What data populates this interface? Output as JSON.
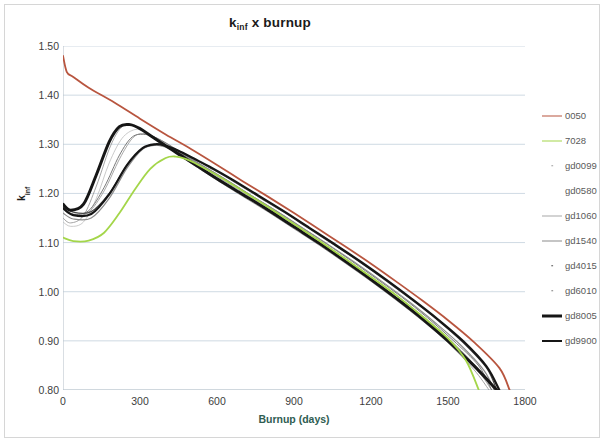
{
  "figure": {
    "title_main": "k",
    "title_sub": "inf",
    "title_tail": " x burnup",
    "title_plain": "k_inf x burnup",
    "background": "#ffffff",
    "border_color": "#d6d6d6"
  },
  "axes": {
    "y_label_main": "k",
    "y_label_sub": "inf",
    "y_label_plain": "k_inf",
    "x_label": "Burnup (days)",
    "x_label_color": "#2f5d52",
    "y_ticks": [
      "1.50",
      "1.40",
      "1.30",
      "1.20",
      "1.10",
      "1.00",
      "0.90",
      "0.80"
    ],
    "x_ticks": [
      "0",
      "300",
      "600",
      "900",
      "1200",
      "1500",
      "1800"
    ],
    "grid_color": "#c3d0dc",
    "axis_color": "#b9c3cc"
  },
  "legend": {
    "position": "right",
    "entries": [
      {
        "label": "0050",
        "color": "#b8553f",
        "style": "line",
        "width": 1.8
      },
      {
        "label": "7028",
        "color": "#a4d64a",
        "style": "line",
        "width": 1.8
      },
      {
        "label": "gd0099",
        "color": "#9a9a9a",
        "style": "dot",
        "width": 0.8
      },
      {
        "label": "gd0580",
        "color": "#bdbdbd",
        "style": "none",
        "width": 0.7
      },
      {
        "label": "gd1060",
        "color": "#a8a8a8",
        "style": "line",
        "width": 1.0
      },
      {
        "label": "gd1540",
        "color": "#8c8c8c",
        "style": "line",
        "width": 1.2
      },
      {
        "label": "gd4015",
        "color": "#4a4a4a",
        "style": "dot",
        "width": 1.2
      },
      {
        "label": "gd6010",
        "color": "#7a7a7a",
        "style": "dot",
        "width": 1.0
      },
      {
        "label": "gd8005",
        "color": "#161616",
        "style": "line",
        "width": 3.0
      },
      {
        "label": "gd9900",
        "color": "#161616",
        "style": "line",
        "width": 2.2
      }
    ]
  },
  "chart_data": {
    "type": "line",
    "xlabel": "Burnup (days)",
    "ylabel": "k_inf",
    "xlim": [
      0,
      1800
    ],
    "ylim": [
      0.8,
      1.5
    ],
    "xticks": [
      0,
      300,
      600,
      900,
      1200,
      1500,
      1800
    ],
    "yticks": [
      0.8,
      0.9,
      1.0,
      1.1,
      1.2,
      1.3,
      1.4,
      1.5
    ],
    "grid": "horizontal",
    "legend_position": "right",
    "series": [
      {
        "name": "0050",
        "color": "#b8553f",
        "width": 1.8,
        "x": [
          0,
          15,
          40,
          100,
          200,
          300,
          400,
          500,
          600,
          700,
          800,
          900,
          1000,
          1100,
          1200,
          1300,
          1400,
          1500,
          1600,
          1700,
          1740
        ],
        "y": [
          1.48,
          1.447,
          1.437,
          1.415,
          1.385,
          1.352,
          1.32,
          1.29,
          1.258,
          1.225,
          1.193,
          1.16,
          1.126,
          1.092,
          1.057,
          1.02,
          0.982,
          0.942,
          0.898,
          0.845,
          0.8
        ]
      },
      {
        "name": "7028",
        "color": "#a4d64a",
        "width": 1.8,
        "x": [
          0,
          40,
          100,
          160,
          220,
          280,
          340,
          400,
          440,
          480,
          520,
          600,
          700,
          800,
          900,
          1000,
          1100,
          1200,
          1300,
          1400,
          1500,
          1570,
          1620
        ],
        "y": [
          1.11,
          1.103,
          1.104,
          1.12,
          1.16,
          1.208,
          1.25,
          1.272,
          1.275,
          1.27,
          1.26,
          1.237,
          1.205,
          1.172,
          1.138,
          1.103,
          1.067,
          1.03,
          0.992,
          0.95,
          0.905,
          0.86,
          0.8
        ]
      },
      {
        "name": "gd0099",
        "color": "#9a9a9a",
        "width": 0.9,
        "x": [
          0,
          30,
          80,
          130,
          180,
          220,
          260,
          300,
          340,
          400,
          460,
          520,
          600,
          700,
          800,
          900,
          1000,
          1100,
          1200,
          1300,
          1400,
          1500,
          1600,
          1660
        ],
        "y": [
          1.15,
          1.14,
          1.155,
          1.215,
          1.29,
          1.33,
          1.342,
          1.332,
          1.318,
          1.296,
          1.275,
          1.254,
          1.227,
          1.194,
          1.162,
          1.128,
          1.094,
          1.058,
          1.021,
          0.982,
          0.941,
          0.896,
          0.842,
          0.8
        ]
      },
      {
        "name": "gd0580",
        "color": "#bdbdbd",
        "width": 0.8,
        "x": [
          0,
          30,
          80,
          130,
          180,
          230,
          280,
          320,
          360,
          420,
          480,
          540,
          620,
          720,
          820,
          920,
          1020,
          1120,
          1220,
          1320,
          1420,
          1520,
          1620,
          1670
        ],
        "y": [
          1.142,
          1.133,
          1.142,
          1.19,
          1.262,
          1.312,
          1.33,
          1.325,
          1.312,
          1.292,
          1.272,
          1.252,
          1.224,
          1.191,
          1.158,
          1.124,
          1.09,
          1.054,
          1.017,
          0.977,
          0.935,
          0.889,
          0.836,
          0.8
        ]
      },
      {
        "name": "gd1060",
        "color": "#a8a8a8",
        "width": 1.0,
        "x": [
          0,
          40,
          100,
          160,
          220,
          270,
          310,
          350,
          400,
          460,
          520,
          600,
          700,
          800,
          900,
          1000,
          1100,
          1200,
          1300,
          1400,
          1500,
          1600,
          1670
        ],
        "y": [
          1.168,
          1.156,
          1.162,
          1.205,
          1.27,
          1.312,
          1.322,
          1.316,
          1.302,
          1.282,
          1.262,
          1.235,
          1.202,
          1.17,
          1.136,
          1.102,
          1.067,
          1.03,
          0.992,
          0.951,
          0.906,
          0.853,
          0.8
        ]
      },
      {
        "name": "gd1540",
        "color": "#8c8c8c",
        "width": 1.2,
        "x": [
          0,
          40,
          110,
          180,
          250,
          310,
          360,
          400,
          450,
          510,
          570,
          650,
          750,
          850,
          950,
          1050,
          1150,
          1250,
          1350,
          1450,
          1550,
          1640,
          1680
        ],
        "y": [
          1.16,
          1.148,
          1.15,
          1.19,
          1.252,
          1.29,
          1.298,
          1.294,
          1.283,
          1.266,
          1.248,
          1.223,
          1.19,
          1.158,
          1.124,
          1.09,
          1.055,
          1.018,
          0.979,
          0.937,
          0.891,
          0.84,
          0.8
        ]
      },
      {
        "name": "gd4015",
        "color": "#4a4a4a",
        "width": 1.2,
        "x": [
          0,
          40,
          110,
          180,
          250,
          310,
          360,
          400,
          450,
          510,
          580,
          660,
          760,
          860,
          960,
          1060,
          1160,
          1260,
          1360,
          1460,
          1560,
          1650,
          1690
        ],
        "y": [
          1.176,
          1.162,
          1.163,
          1.2,
          1.258,
          1.292,
          1.3,
          1.296,
          1.286,
          1.27,
          1.25,
          1.226,
          1.194,
          1.162,
          1.128,
          1.094,
          1.059,
          1.022,
          0.983,
          0.942,
          0.896,
          0.845,
          0.8
        ]
      },
      {
        "name": "gd6010",
        "color": "#7a7a7a",
        "width": 1.0,
        "x": [
          0,
          40,
          100,
          160,
          220,
          270,
          320,
          360,
          410,
          470,
          540,
          620,
          720,
          820,
          920,
          1020,
          1120,
          1220,
          1320,
          1420,
          1520,
          1620,
          1670
        ],
        "y": [
          1.172,
          1.158,
          1.165,
          1.212,
          1.278,
          1.315,
          1.32,
          1.314,
          1.3,
          1.28,
          1.258,
          1.233,
          1.2,
          1.168,
          1.134,
          1.1,
          1.064,
          1.027,
          0.989,
          0.947,
          0.901,
          0.849,
          0.8
        ]
      },
      {
        "name": "gd8005",
        "color": "#161616",
        "width": 3.0,
        "x": [
          0,
          30,
          80,
          130,
          180,
          220,
          260,
          300,
          340,
          400,
          460,
          520,
          600,
          700,
          800,
          900,
          1000,
          1100,
          1200,
          1300,
          1400,
          1500,
          1600,
          1690
        ],
        "y": [
          1.178,
          1.166,
          1.178,
          1.238,
          1.305,
          1.336,
          1.34,
          1.332,
          1.318,
          1.297,
          1.277,
          1.257,
          1.23,
          1.198,
          1.166,
          1.132,
          1.098,
          1.062,
          1.025,
          0.986,
          0.945,
          0.9,
          0.85,
          0.8
        ]
      },
      {
        "name": "gd9900",
        "color": "#161616",
        "width": 2.2,
        "x": [
          0,
          40,
          110,
          180,
          250,
          310,
          360,
          400,
          450,
          510,
          580,
          660,
          760,
          860,
          960,
          1060,
          1160,
          1260,
          1360,
          1460,
          1560,
          1650,
          1700
        ],
        "y": [
          1.17,
          1.156,
          1.158,
          1.198,
          1.258,
          1.292,
          1.3,
          1.297,
          1.287,
          1.271,
          1.252,
          1.228,
          1.196,
          1.164,
          1.13,
          1.096,
          1.061,
          1.024,
          0.985,
          0.944,
          0.899,
          0.848,
          0.8
        ]
      }
    ]
  }
}
